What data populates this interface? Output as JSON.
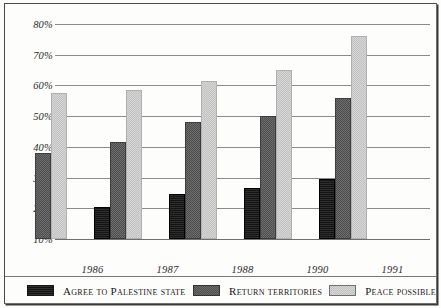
{
  "chart_data": {
    "type": "bar",
    "title": "",
    "subtitle": "",
    "xlabel": "",
    "ylabel": "",
    "categories": [
      "1986",
      "1987",
      "1988",
      "1990",
      "1991"
    ],
    "ylim": [
      10,
      80
    ],
    "ytick_labels": [
      "10%",
      "20%",
      "30%",
      "40%",
      "50%",
      "60%",
      "70%",
      "80%"
    ],
    "ytick_values": [
      10,
      20,
      30,
      40,
      50,
      60,
      70,
      80
    ],
    "grid": true,
    "legend_position": "bottom",
    "series": [
      {
        "name": "Agree to Palestine state",
        "color": "#151515",
        "values": [
          null,
          20.5,
          24.5,
          26.5,
          29.5
        ]
      },
      {
        "name": "Return territories",
        "color": "#5b5b5b",
        "values": [
          38,
          41.5,
          48,
          50,
          56
        ]
      },
      {
        "name": "Peace possible",
        "color": "#c9c9c9",
        "values": [
          57.5,
          58.5,
          61.5,
          65,
          76
        ]
      }
    ]
  },
  "legend": {
    "items": [
      {
        "label": "Agree to Palestine state",
        "swatch": "black-swatch"
      },
      {
        "label": "Return territories",
        "swatch": "dark-gray-swatch"
      },
      {
        "label": "Peace possible",
        "swatch": "light-gray-swatch"
      }
    ]
  },
  "axis": {
    "y_ticks": [
      "80%",
      "70%",
      "60%",
      "50%",
      "40%",
      "30%",
      "20%",
      "10%"
    ],
    "x_ticks": [
      "1986",
      "1987",
      "1988",
      "1990",
      "1991"
    ]
  }
}
